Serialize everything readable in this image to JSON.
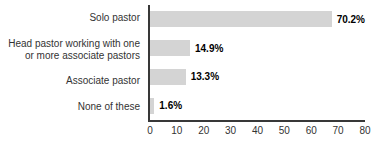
{
  "chart_data": {
    "type": "bar",
    "orientation": "horizontal",
    "title": "",
    "xlabel": "",
    "ylabel": "",
    "categories": [
      "Solo pastor",
      "Head pastor working with one or more associate pastors",
      "Associate pastor",
      "None of these"
    ],
    "category_label_lines": [
      [
        "Solo pastor"
      ],
      [
        "Head pastor working with one",
        "or more associate pastors"
      ],
      [
        "Associate pastor"
      ],
      [
        "None of these"
      ]
    ],
    "values": [
      70.2,
      14.9,
      13.3,
      1.6
    ],
    "value_labels": [
      "70.2%",
      "14.9%",
      "13.3%",
      "1.6%"
    ],
    "x_ticks": [
      0,
      10,
      20,
      30,
      40,
      50,
      60,
      70,
      80
    ],
    "xlim": [
      0,
      80
    ],
    "grid": false,
    "legend": "none",
    "bar_color": "#d4d4d4",
    "axis_color": "#383838",
    "value_label_color": "#000000",
    "category_label_color": "#333333"
  }
}
